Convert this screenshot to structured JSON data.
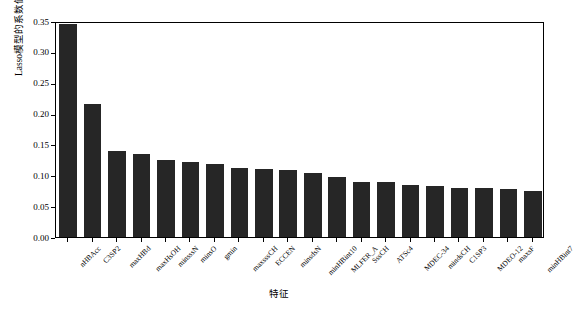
{
  "chart_data": {
    "type": "bar",
    "title": "",
    "xlabel": "特征",
    "ylabel": "Lasso模型的系数值",
    "ylim": [
      0.0,
      0.35
    ],
    "yticks": [
      "0.00",
      "0.05",
      "0.10",
      "0.15",
      "0.20",
      "0.25",
      "0.30",
      "0.35"
    ],
    "ytick_values": [
      0.0,
      0.05,
      0.1,
      0.15,
      0.2,
      0.25,
      0.3,
      0.35
    ],
    "grid": false,
    "legend": null,
    "bar_color": "#262626",
    "categories": [
      "nHBAcc",
      "C3SP2",
      "maxHBd",
      "maxHsOH",
      "minsssN",
      "minsO",
      "gmin",
      "maxsssCH",
      "ECCEN",
      "minsdsN",
      "minHBint10",
      "MLFER_A",
      "SssCH",
      "ATSc4",
      "MDEC-34",
      "mindsCH",
      "C1SP3",
      "MDEO-12",
      "maxsF",
      "minHBint7"
    ],
    "values": [
      0.345,
      0.216,
      0.139,
      0.135,
      0.125,
      0.121,
      0.119,
      0.112,
      0.11,
      0.108,
      0.104,
      0.097,
      0.089,
      0.089,
      0.085,
      0.082,
      0.079,
      0.079,
      0.078,
      0.074
    ]
  }
}
